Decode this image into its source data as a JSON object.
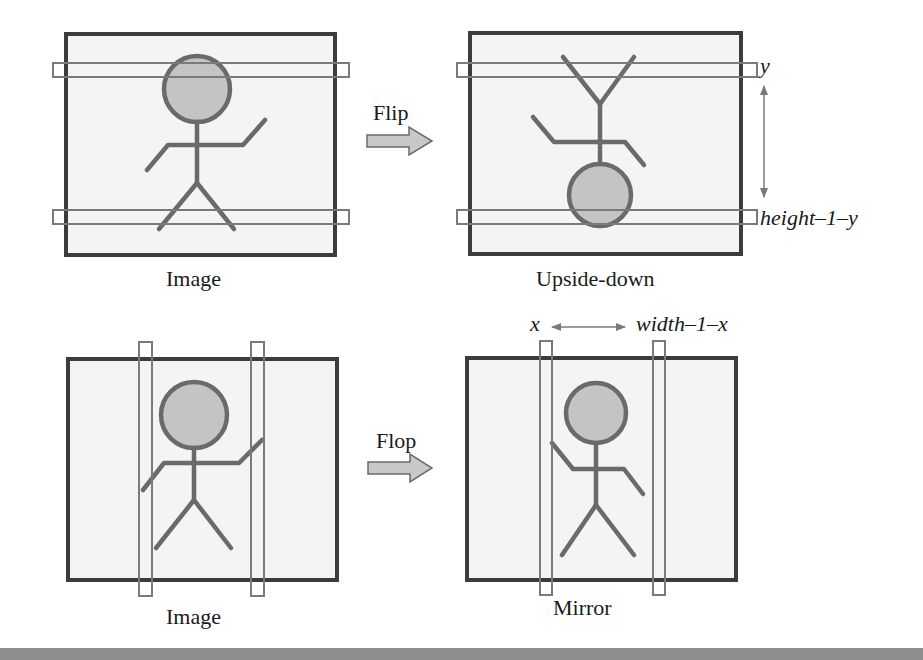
{
  "diagram": {
    "colors": {
      "frame": "#3c3c3c",
      "frame_fill": "#f4f4f4",
      "figure": "#6a6a6a",
      "head_fill": "#c4c4c4",
      "strip": "#7a7a7a",
      "arrow_fill": "#c8c8c8",
      "bottom_bar": "#8e8e8e"
    },
    "panels": [
      {
        "id": "top-left",
        "caption": "Image"
      },
      {
        "id": "top-right",
        "caption": "Upside-down"
      },
      {
        "id": "bottom-left",
        "caption": "Image"
      },
      {
        "id": "bottom-right",
        "caption": "Mirror"
      }
    ],
    "operations": [
      {
        "label": "Flip"
      },
      {
        "label": "Flop"
      }
    ],
    "annotations": {
      "row_y": "y",
      "row_mirror": "height–1–y",
      "col_x": "x",
      "col_mirror": "width–1–x"
    }
  }
}
